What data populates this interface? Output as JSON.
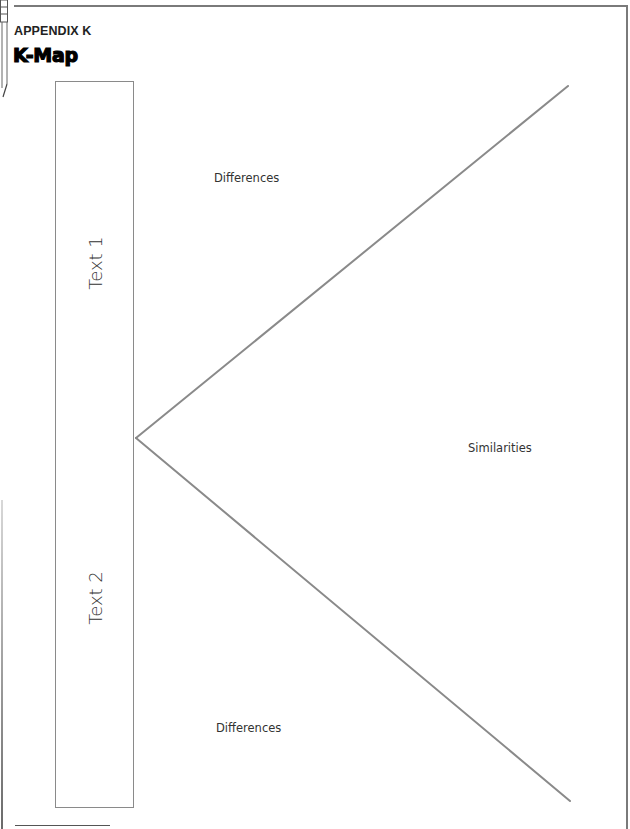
{
  "header": {
    "appendix_label": "APPENDIX K",
    "title": "K-Map"
  },
  "kmap": {
    "box_labels": [
      "Text 1",
      "Text 2"
    ],
    "region_labels": {
      "top": "Differences",
      "middle": "Similarities",
      "bottom": "Differences"
    },
    "line_color": "#8a8a8a"
  }
}
